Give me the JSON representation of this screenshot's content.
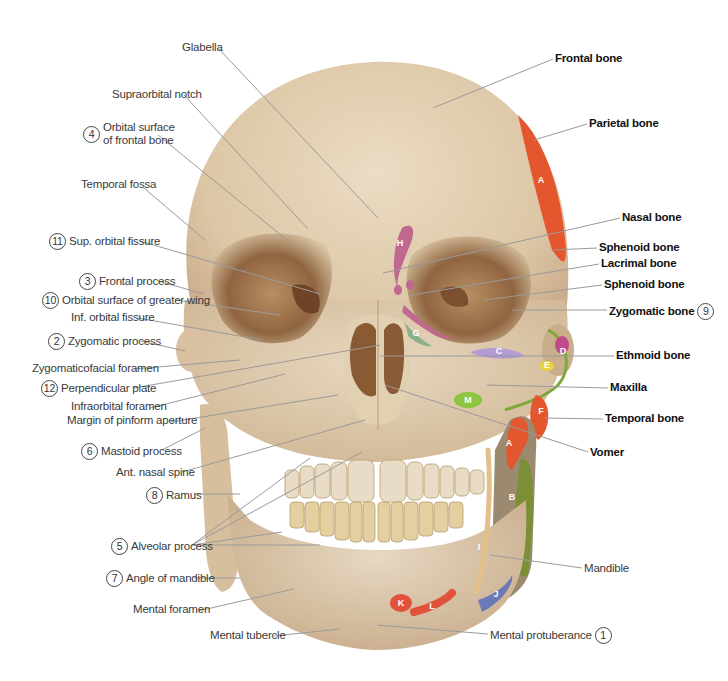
{
  "figure": {
    "view": "Anterior view of skull",
    "colors": {
      "bone_light": "#e6d7bf",
      "bone_mid": "#d5bd9a",
      "bone_dark": "#8a5c34",
      "leader": "#9a9a9a",
      "parietal": "#e4572e",
      "temporal": "#e4572e",
      "sphenoid": "#e4572e",
      "mandible_green": "#7a8f36",
      "ethmoid_lavender": "#b59bd6",
      "lacrimal_pink": "#c0688f",
      "zygomatic_magenta": "#c24a8a",
      "yellow": "#e8d43a",
      "green_m": "#8cc63f",
      "blue_j": "#6c79b8",
      "red_kl": "#e0523a",
      "tan_i": "#e3c08a"
    }
  },
  "left_labels": [
    {
      "id": "glabella",
      "text": "Glabella",
      "num": null,
      "x": 182,
      "y": 41,
      "tx": 378,
      "ty": 218,
      "lx": 218,
      "ly": 48
    },
    {
      "id": "supraorbital-notch",
      "text": "Supraorbital notch",
      "num": null,
      "x": 112,
      "y": 88,
      "tx": 308,
      "ty": 229,
      "lx": 184,
      "ly": 95
    },
    {
      "id": "orbital-surface-frontal",
      "text": "Orbital surface\nof frontal bone",
      "num": "4",
      "x": 80,
      "y": 121,
      "tx": 298,
      "ty": 249,
      "lx": 158,
      "ly": 135
    },
    {
      "id": "temporal-fossa",
      "text": "Temporal fossa",
      "num": null,
      "x": 81,
      "y": 178,
      "tx": 205,
      "ty": 240,
      "lx": 144,
      "ly": 188
    },
    {
      "id": "sup-orbital-fissure",
      "text": "Sup. orbital fissure",
      "num": "11",
      "x": 46,
      "y": 233,
      "tx": 320,
      "ty": 294,
      "lx": 140,
      "ly": 241
    },
    {
      "id": "frontal-process",
      "text": "Frontal process",
      "num": "3",
      "x": 76,
      "y": 273,
      "tx": 204,
      "ty": 294,
      "lx": 158,
      "ly": 281
    },
    {
      "id": "orbital-surface-greater-wing",
      "text": "Orbital surface of greater wing",
      "num": "10",
      "x": 39,
      "y": 292,
      "tx": 280,
      "ty": 315,
      "lx": 176,
      "ly": 300
    },
    {
      "id": "inf-orbital-fissure",
      "text": "Inf. orbital fissure",
      "num": null,
      "x": 71,
      "y": 311,
      "tx": 262,
      "ty": 340,
      "lx": 138,
      "ly": 318
    },
    {
      "id": "zygomatic-process",
      "text": "Zygomatic process",
      "num": "2",
      "x": 45,
      "y": 333,
      "tx": 185,
      "ty": 351,
      "lx": 141,
      "ly": 341
    },
    {
      "id": "zygomaticofacial-foramen",
      "text": "Zygomaticofacial foramen",
      "num": null,
      "x": 32,
      "y": 362,
      "tx": 240,
      "ty": 360,
      "lx": 134,
      "ly": 369
    },
    {
      "id": "perpendicular-plate",
      "text": "Perpendicular plate",
      "num": "12",
      "x": 38,
      "y": 380,
      "tx": 380,
      "ty": 345,
      "lx": 134,
      "ly": 388
    },
    {
      "id": "infraorbital-foramen",
      "text": "Infraorbital foramen",
      "num": null,
      "x": 71,
      "y": 400,
      "tx": 285,
      "ty": 374,
      "lx": 150,
      "ly": 408
    },
    {
      "id": "margin-piriform-aperture",
      "text": "Margin of pinform aperture",
      "num": null,
      "x": 67,
      "y": 414,
      "tx": 338,
      "ty": 395,
      "lx": 171,
      "ly": 422
    },
    {
      "id": "mastoid-process",
      "text": "Mastoid process",
      "num": "6",
      "x": 78,
      "y": 443,
      "tx": 205,
      "ty": 428,
      "lx": 162,
      "ly": 450
    },
    {
      "id": "ant-nasal-spine",
      "text": "Ant. nasal spine",
      "num": null,
      "x": 116,
      "y": 466,
      "tx": 365,
      "ty": 420,
      "lx": 182,
      "ly": 472
    },
    {
      "id": "ramus",
      "text": "Ramus",
      "num": "8",
      "x": 143,
      "y": 487,
      "tx": 240,
      "ty": 494,
      "lx": 194,
      "ly": 494
    },
    {
      "id": "alveolar-process",
      "text": "Alveolar process",
      "num": "5",
      "x": 108,
      "y": 538,
      "tx": 320,
      "ty": 545,
      "lx": 192,
      "ly": 545
    },
    {
      "id": "angle-of-mandible",
      "text": "Angle of mandible",
      "num": "7",
      "x": 103,
      "y": 570,
      "tx": 240,
      "ty": 578,
      "lx": 194,
      "ly": 578
    },
    {
      "id": "mental-foramen",
      "text": "Mental foramen",
      "num": null,
      "x": 133,
      "y": 603,
      "tx": 294,
      "ty": 589,
      "lx": 198,
      "ly": 611
    },
    {
      "id": "mental-tubercle",
      "text": "Mental tubercle",
      "num": null,
      "x": 210,
      "y": 629,
      "tx": 340,
      "ty": 629,
      "lx": 274,
      "ly": 636
    }
  ],
  "alveolar_extra_targets": [
    {
      "tx": 310,
      "ty": 458
    },
    {
      "tx": 362,
      "ty": 452
    },
    {
      "tx": 282,
      "ty": 532
    }
  ],
  "right_labels": [
    {
      "id": "frontal-bone",
      "text": "Frontal bone",
      "num": null,
      "bold": true,
      "x": 555,
      "y": 52,
      "tx": 433,
      "ty": 108,
      "lx": 553,
      "ly": 59
    },
    {
      "id": "parietal-bone",
      "text": "Parietal bone",
      "num": null,
      "bold": true,
      "x": 589,
      "y": 117,
      "tx": 534,
      "ty": 140,
      "lx": 587,
      "ly": 124
    },
    {
      "id": "nasal-bone",
      "text": "Nasal bone",
      "num": null,
      "bold": true,
      "x": 622,
      "y": 211,
      "tx": 383,
      "ty": 273,
      "lx": 620,
      "ly": 218
    },
    {
      "id": "sphenoid-bone-1",
      "text": "Sphenoid bone",
      "num": null,
      "bold": true,
      "x": 599,
      "y": 241,
      "tx": 553,
      "ty": 250,
      "lx": 597,
      "ly": 248
    },
    {
      "id": "lacrimal-bone",
      "text": "Lacrimal bone",
      "num": null,
      "bold": true,
      "x": 601,
      "y": 257,
      "tx": 412,
      "ty": 295,
      "lx": 599,
      "ly": 264
    },
    {
      "id": "sphenoid-bone-2",
      "text": "Sphenoid bone",
      "num": null,
      "bold": true,
      "x": 604,
      "y": 278,
      "tx": 484,
      "ty": 300,
      "lx": 602,
      "ly": 285
    },
    {
      "id": "zygomatic-bone",
      "text": "Zygomatic bone",
      "num": "9",
      "bold": true,
      "x": 609,
      "y": 303,
      "tx": 512,
      "ty": 310,
      "lx": 607,
      "ly": 310
    },
    {
      "id": "ethmoid-bone",
      "text": "Ethmoid bone",
      "num": null,
      "bold": true,
      "x": 616,
      "y": 349,
      "tx": 380,
      "ty": 356,
      "lx": 614,
      "ly": 356
    },
    {
      "id": "maxilla",
      "text": "Maxilla",
      "num": null,
      "bold": true,
      "x": 610,
      "y": 381,
      "tx": 487,
      "ty": 385,
      "lx": 608,
      "ly": 388
    },
    {
      "id": "temporal-bone",
      "text": "Temporal bone",
      "num": null,
      "bold": true,
      "x": 605,
      "y": 412,
      "tx": 545,
      "ty": 418,
      "lx": 603,
      "ly": 419
    },
    {
      "id": "vomer",
      "text": "Vomer",
      "num": null,
      "bold": true,
      "x": 590,
      "y": 446,
      "tx": 385,
      "ty": 385,
      "lx": 588,
      "ly": 452
    },
    {
      "id": "mandible",
      "text": "Mandible",
      "num": null,
      "bold": false,
      "x": 584,
      "y": 562,
      "tx": 490,
      "ty": 555,
      "lx": 582,
      "ly": 568
    },
    {
      "id": "mental-protuberance",
      "text": "Mental protuberance",
      "num": "1",
      "bold": false,
      "x": 490,
      "y": 627,
      "tx": 377,
      "ty": 625,
      "lx": 488,
      "ly": 634
    }
  ],
  "markers": [
    {
      "id": "A",
      "x": 541,
      "y": 180,
      "color": "#e4572e"
    },
    {
      "id": "A",
      "x": 509,
      "y": 443,
      "color": "#e4572e"
    },
    {
      "id": "B",
      "x": 512,
      "y": 497,
      "color": "#7a8f36"
    },
    {
      "id": "C",
      "x": 499,
      "y": 351,
      "color": "#b59bd6"
    },
    {
      "id": "D",
      "x": 563,
      "y": 351,
      "color": "#c24a8a"
    },
    {
      "id": "E",
      "x": 547,
      "y": 365,
      "color": "#e8d43a"
    },
    {
      "id": "F",
      "x": 541,
      "y": 411,
      "color": "#e4572e"
    },
    {
      "id": "G",
      "x": 416,
      "y": 333,
      "color": "#7fa66a"
    },
    {
      "id": "H",
      "x": 400,
      "y": 243,
      "color": "#c0688f"
    },
    {
      "id": "I",
      "x": 479,
      "y": 547,
      "color": "#e3c08a"
    },
    {
      "id": "J",
      "x": 496,
      "y": 594,
      "color": "#6c79b8"
    },
    {
      "id": "K",
      "x": 401,
      "y": 603,
      "color": "#e0523a"
    },
    {
      "id": "L",
      "x": 432,
      "y": 606,
      "color": "#e0523a"
    },
    {
      "id": "M",
      "x": 468,
      "y": 400,
      "color": "#8cc63f"
    }
  ]
}
